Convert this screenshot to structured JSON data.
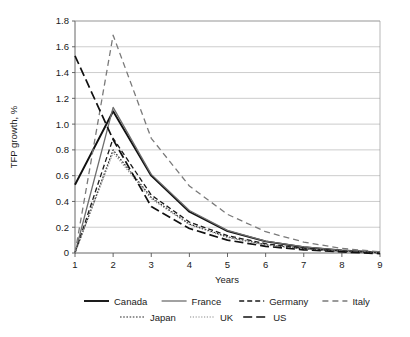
{
  "chart_data": {
    "type": "line",
    "title": "",
    "xlabel": "Years",
    "ylabel": "TFP growth, %",
    "x": [
      1,
      2,
      3,
      4,
      5,
      6,
      7,
      8,
      9
    ],
    "xlim": [
      1,
      9
    ],
    "ylim": [
      0,
      1.8
    ],
    "ytick_labels": [
      "1.8",
      "1.6",
      "1.4",
      "1.2",
      "1.0",
      "0.8",
      "0.6",
      "0.4",
      "0.2",
      "0"
    ],
    "ytick_values": [
      1.8,
      1.6,
      1.4,
      1.2,
      1.0,
      0.8,
      0.6,
      0.4,
      0.2,
      0.0
    ],
    "xtick_labels": [
      "1",
      "2",
      "3",
      "4",
      "5",
      "6",
      "7",
      "8",
      "9"
    ],
    "grid": "horizontal",
    "legend_position": "bottom",
    "series": [
      {
        "name": "Canada",
        "style": "solid",
        "color": "#111111",
        "width": 1.9,
        "dash": "",
        "values": [
          0.53,
          1.1,
          0.6,
          0.32,
          0.17,
          0.09,
          0.045,
          0.02,
          0.005
        ]
      },
      {
        "name": "France",
        "style": "solid",
        "color": "#6e6e6e",
        "width": 1.3,
        "dash": "",
        "values": [
          0.0,
          1.13,
          0.61,
          0.33,
          0.175,
          0.092,
          0.047,
          0.021,
          0.006
        ]
      },
      {
        "name": "Germany",
        "style": "dashed",
        "color": "#1a1a1a",
        "width": 1.3,
        "dash": "5,3",
        "values": [
          0.0,
          0.89,
          0.45,
          0.24,
          0.135,
          0.072,
          0.035,
          0.015,
          0.003
        ]
      },
      {
        "name": "Italy",
        "style": "long-dashed",
        "color": "#7a7a7a",
        "width": 1.3,
        "dash": "6,4",
        "values": [
          0.0,
          1.69,
          0.89,
          0.52,
          0.3,
          0.165,
          0.085,
          0.035,
          0.01
        ]
      },
      {
        "name": "Japan",
        "style": "dotted",
        "color": "#2a2a2a",
        "width": 1.2,
        "dash": "1.6,1.6",
        "values": [
          0.0,
          0.8,
          0.43,
          0.225,
          0.125,
          0.065,
          0.032,
          0.013,
          0.002
        ]
      },
      {
        "name": "UK",
        "style": "fine-dotted",
        "color": "#8a8a8a",
        "width": 1.2,
        "dash": "1.2,1.6",
        "values": [
          0.0,
          0.78,
          0.42,
          0.22,
          0.12,
          0.062,
          0.03,
          0.012,
          0.001
        ]
      },
      {
        "name": "US",
        "style": "dash-long",
        "color": "#111111",
        "width": 1.7,
        "dash": "9,4",
        "values": [
          1.53,
          0.88,
          0.36,
          0.19,
          0.1,
          0.052,
          0.025,
          0.008,
          -0.005
        ]
      }
    ]
  },
  "legend": {
    "row1": [
      "Canada",
      "France",
      "Germany",
      "Italy"
    ],
    "row2": [
      "Japan",
      "UK",
      "US"
    ]
  }
}
